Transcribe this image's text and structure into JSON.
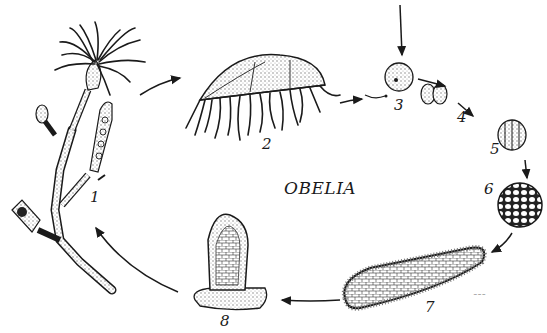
{
  "diagram": {
    "title": "OBELIA",
    "type": "life-cycle illustration",
    "stages": [
      {
        "number": "1",
        "name": "polyp colony"
      },
      {
        "number": "2",
        "name": "medusa"
      },
      {
        "number": "3",
        "name": "fertilized egg (zygote) with sperm"
      },
      {
        "number": "4",
        "name": "two-cell stage"
      },
      {
        "number": "5",
        "name": "four-cell stage"
      },
      {
        "number": "6",
        "name": "blastula"
      },
      {
        "number": "7",
        "name": "planula larva"
      },
      {
        "number": "8",
        "name": "young polyp"
      }
    ],
    "labels": [
      "1",
      "2",
      "3",
      "4",
      "5",
      "6",
      "7",
      "8"
    ]
  },
  "colors": {
    "ink": "#1a1a1a",
    "background": "#ffffff",
    "stipple": "#9a9a9a"
  }
}
